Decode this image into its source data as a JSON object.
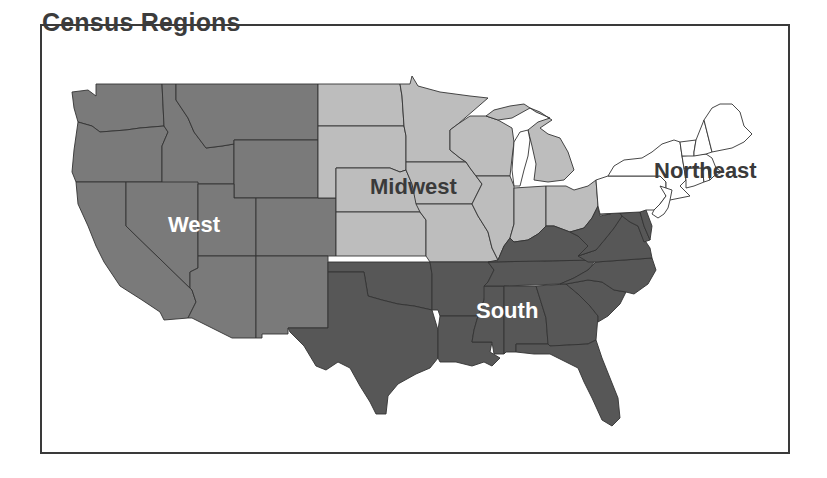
{
  "title": "Census Regions",
  "regions": [
    {
      "name": "West",
      "label": "West",
      "color": "#7a7a7a",
      "label_color": "#ffffff",
      "states": [
        "Washington",
        "Oregon",
        "California",
        "Idaho",
        "Nevada",
        "Montana",
        "Wyoming",
        "Utah",
        "Colorado",
        "Arizona",
        "New Mexico"
      ]
    },
    {
      "name": "Midwest",
      "label": "Midwest",
      "color": "#bdbdbd",
      "label_color": "#3a3a3a",
      "states": [
        "North Dakota",
        "South Dakota",
        "Nebraska",
        "Kansas",
        "Minnesota",
        "Iowa",
        "Missouri",
        "Wisconsin",
        "Illinois",
        "Michigan",
        "Indiana",
        "Ohio"
      ]
    },
    {
      "name": "South",
      "label": "South",
      "color": "#575757",
      "label_color": "#ffffff",
      "states": [
        "Texas",
        "Oklahoma",
        "Arkansas",
        "Louisiana",
        "Mississippi",
        "Alabama",
        "Tennessee",
        "Kentucky",
        "Georgia",
        "Florida",
        "South Carolina",
        "North Carolina",
        "Virginia",
        "West Virginia",
        "Maryland",
        "Delaware"
      ]
    },
    {
      "name": "Northeast",
      "label": "Northeast",
      "color": "#ffffff",
      "label_color": "#3a3a3a",
      "states": [
        "Pennsylvania",
        "New York",
        "New Jersey",
        "Connecticut",
        "Rhode Island",
        "Massachusetts",
        "Vermont",
        "New Hampshire",
        "Maine"
      ]
    }
  ],
  "labels": {
    "west": "West",
    "midwest": "Midwest",
    "south": "South",
    "northeast": "Northeast"
  }
}
